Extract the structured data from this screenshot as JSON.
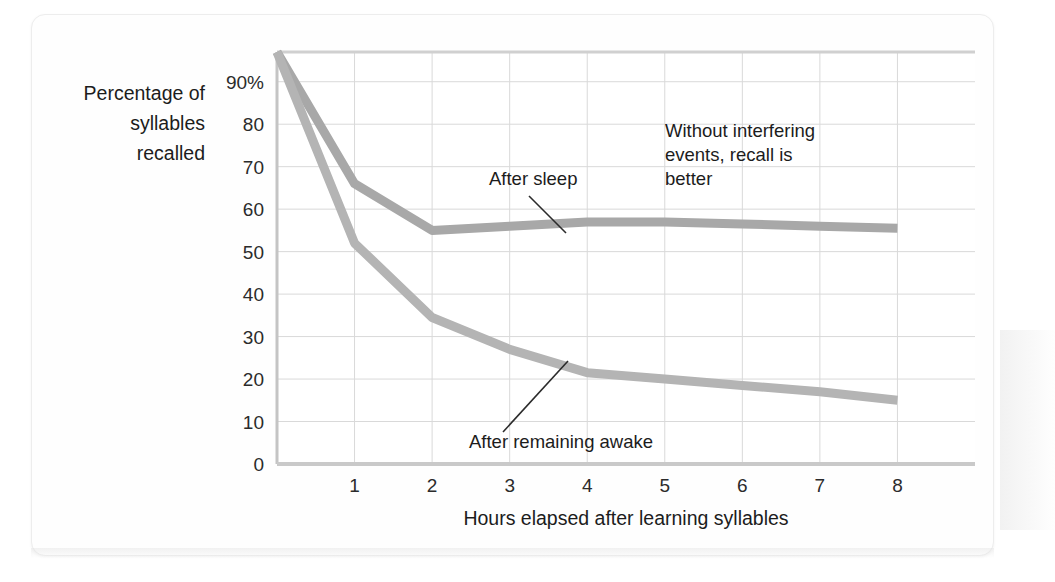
{
  "figure": {
    "background_color": "#fefefe",
    "card_border_color": "#ededed"
  },
  "chart_data": {
    "type": "line",
    "title": "",
    "xlabel": "Hours elapsed after learning syllables",
    "ylabel": "Percentage of syllables recalled",
    "ylabel_lines": [
      "Percentage of",
      "syllables",
      "recalled"
    ],
    "xlim": [
      0,
      9
    ],
    "ylim": [
      0,
      97
    ],
    "grid": true,
    "legend_position": "inline-annotations",
    "x_tick_labels": [
      "1",
      "2",
      "3",
      "4",
      "5",
      "6",
      "7",
      "8"
    ],
    "x_ticks": [
      1,
      2,
      3,
      4,
      5,
      6,
      7,
      8
    ],
    "y_tick_labels": [
      "90%",
      "80",
      "70",
      "60",
      "50",
      "40",
      "30",
      "20",
      "10",
      "0"
    ],
    "y_ticks": [
      90,
      80,
      70,
      60,
      50,
      40,
      30,
      20,
      10,
      0
    ],
    "series": [
      {
        "name": "After sleep",
        "color": "#a8a8a8",
        "x": [
          0,
          1,
          2,
          3,
          4,
          5,
          6,
          7,
          8
        ],
        "values": [
          97,
          66,
          55,
          56,
          57,
          57,
          56.5,
          56,
          55.5
        ]
      },
      {
        "name": "After remaining awake",
        "color": "#b4b4b4",
        "x": [
          0,
          1,
          2,
          3,
          4,
          5,
          6,
          7,
          8
        ],
        "values": [
          97,
          52,
          34.5,
          27,
          21.5,
          20,
          18.5,
          17,
          15
        ]
      }
    ],
    "annotations": [
      {
        "id": "after-sleep",
        "text": "After sleep",
        "lines": [
          "After sleep"
        ],
        "leader": true
      },
      {
        "id": "after-remaining-awake",
        "text": "After remaining awake",
        "lines": [
          "After remaining awake"
        ],
        "leader": true
      },
      {
        "id": "without-interfering-events",
        "text": "Without interfering events, recall is better",
        "lines": [
          "Without interfering",
          "events, recall is",
          "better"
        ],
        "leader": false
      }
    ]
  }
}
